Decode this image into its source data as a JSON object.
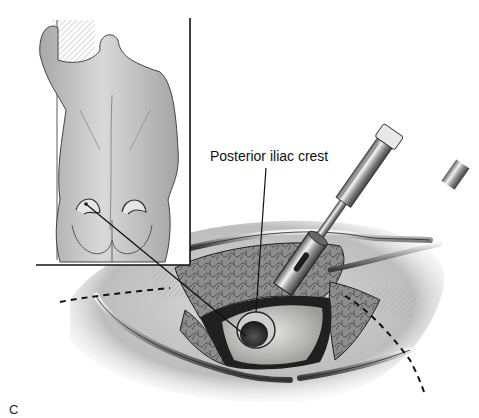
{
  "figure": {
    "panel_letter": "C",
    "callout_label": "Posterior iliac crest",
    "inset_subject": "child-back-posterior-view",
    "main_subject": "bone-marrow-trephine-into-iliac-crest-through-retracted-incision",
    "colors": {
      "background": "#ffffff",
      "line": "#111111",
      "skin": "#cfcfcf",
      "tissue": "#8a8a8a",
      "bone": "#d8d8d4",
      "instrument": "#b9b9b9"
    }
  }
}
